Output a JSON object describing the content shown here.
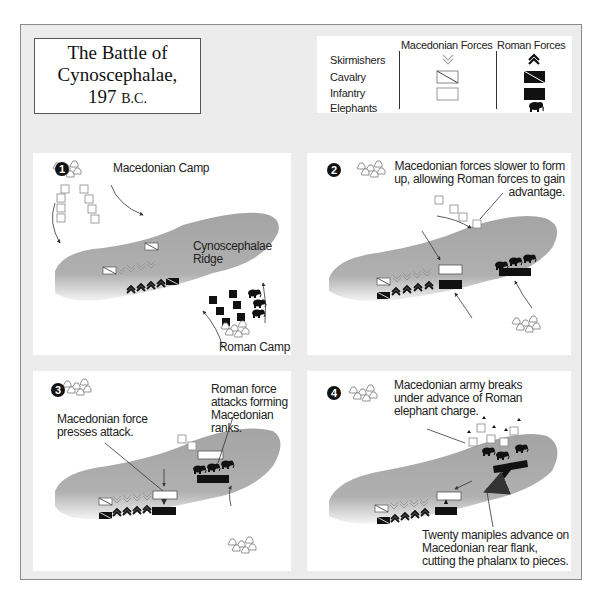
{
  "title": {
    "line1": "The Battle of",
    "line2": "Cynoscephalae,",
    "line3_year": "197",
    "line3_era": "B.C."
  },
  "legend": {
    "headers": [
      "Macedonian Forces",
      "Roman Forces"
    ],
    "rows": [
      {
        "label": "Skirmishers",
        "macedonian_icon": "double-chevron-down-outline",
        "roman_icon": "double-chevron-up-filled"
      },
      {
        "label": "Cavalry",
        "macedonian_icon": "diagonal-rect-outline",
        "roman_icon": "diagonal-rect-filled"
      },
      {
        "label": "Infantry",
        "macedonian_icon": "rect-outline",
        "roman_icon": "rect-filled"
      },
      {
        "label": "Elephants",
        "macedonian_icon": "",
        "roman_icon": "elephant-filled"
      }
    ],
    "colors": {
      "macedonian": "#ffffff",
      "roman": "#111111"
    }
  },
  "panels": [
    {
      "number": "1",
      "labels": {
        "macedonian_camp": "Macedonian Camp",
        "ridge": "Cynoscephalae Ridge",
        "ridge_line1": "Cynoscephalae",
        "ridge_line2": "Ridge",
        "roman_camp": "Roman Camp"
      }
    },
    {
      "number": "2",
      "labels": {
        "note_line1": "Macedonian forces slower to form",
        "note_line2": "up, allowing Roman forces to gain",
        "note_line3": "advantage."
      }
    },
    {
      "number": "3",
      "labels": {
        "left_line1": "Macedonian force",
        "left_line2": "presses attack.",
        "right_line1": "Roman force",
        "right_line2": "attacks forming",
        "right_line3": "Macedonian ranks."
      }
    },
    {
      "number": "4",
      "labels": {
        "top_line1": "Macedonian army breaks",
        "top_line2": "under advance of Roman",
        "top_line3": "elephant charge.",
        "bottom_line1": "Twenty maniples advance on",
        "bottom_line2": "Macedonian rear flank,",
        "bottom_line3": "cutting the phalanx to pieces."
      }
    }
  ],
  "colors": {
    "frame_bg": "#ececec",
    "ridge": "#a8a8a8",
    "roman_units": "#111111",
    "macedonian_units": "#ffffff"
  }
}
